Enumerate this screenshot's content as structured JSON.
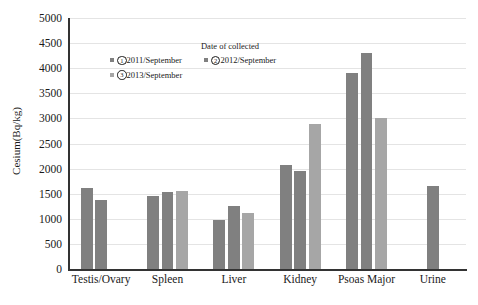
{
  "chart_data": {
    "type": "bar",
    "title": "",
    "xlabel": "",
    "ylabel": "Cesium(Bq/kg)",
    "ylim": [
      0,
      5000
    ],
    "ytick_step": 500,
    "yticks": [
      "5000",
      "4500",
      "4000",
      "3500",
      "3000",
      "2500",
      "2000",
      "1500",
      "1000",
      "500",
      "0"
    ],
    "grid": true,
    "legend_position": "upper-left-inside",
    "categories": [
      "Testis/Ovary",
      "Spleen",
      "Liver",
      "Kidney",
      "Psoas Major",
      "Urine"
    ],
    "series": [
      {
        "name": "①2011/September",
        "color": "#808080",
        "values": [
          1610,
          1460,
          970,
          2080,
          3900,
          null
        ]
      },
      {
        "name": "②2012/September",
        "color": "#808080",
        "values": [
          1380,
          1530,
          1250,
          1960,
          4300,
          1650
        ]
      },
      {
        "name": "③2013/September",
        "color": "#a6a6a6",
        "values": [
          null,
          1560,
          1110,
          2880,
          3000,
          null
        ]
      }
    ]
  },
  "legend": {
    "title": "Date of collected",
    "entries": [
      {
        "marker": "①",
        "label": "2011/September",
        "color": "#808080"
      },
      {
        "marker": "②",
        "label": "2012/September",
        "color": "#808080"
      },
      {
        "marker": "③",
        "label": "2013/September",
        "color": "#a6a6a6"
      }
    ]
  },
  "axis": {
    "y_title": "Cesium(Bq/kg)"
  }
}
